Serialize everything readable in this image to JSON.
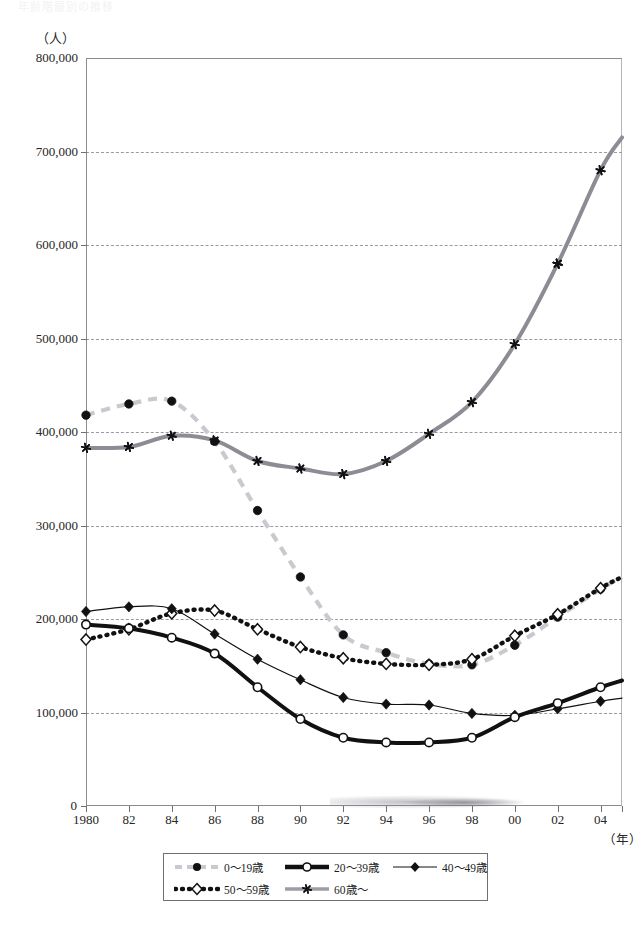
{
  "figure": {
    "title_faint": "年齢階層別の推移",
    "y_unit_label": "（人）",
    "x_unit_label": "（年）"
  },
  "axes": {
    "y_ticks": [
      "800,000",
      "700,000",
      "600,000",
      "500,000",
      "400,000",
      "300,000",
      "200,000",
      "100,000",
      "0"
    ],
    "y_tick_values": [
      800000,
      700000,
      600000,
      500000,
      400000,
      300000,
      200000,
      100000,
      0
    ],
    "x_ticks": [
      "1980",
      "82",
      "84",
      "86",
      "88",
      "90",
      "92",
      "94",
      "96",
      "98",
      "00",
      "02",
      "04"
    ],
    "x_tick_values": [
      1980,
      1982,
      1984,
      1986,
      1988,
      1990,
      1992,
      1994,
      1996,
      1998,
      2000,
      2002,
      2004
    ]
  },
  "legend": {
    "position": "bottom-center",
    "rows": [
      [
        {
          "label": "0〜19歳",
          "key": "dashed-lightgray-circle",
          "color": "#c9c9cf"
        },
        {
          "label": "20〜39歳",
          "key": "solid-thick-black-open-circle",
          "color": "#111111"
        },
        {
          "label": "40〜49歳",
          "key": "solid-thin-black-filled-diamond",
          "color": "#111111"
        }
      ],
      [
        {
          "label": "50〜59歳",
          "key": "dotted-black-open-diamond",
          "color": "#111111"
        },
        {
          "label": "60歳〜",
          "key": "solid-gray-asterisk",
          "color": "#8c8c94"
        }
      ]
    ]
  },
  "chart_data": {
    "type": "line",
    "title": "年齢階層別の推移",
    "xlabel": "（年）",
    "ylabel": "（人）",
    "xlim": [
      1980,
      2005
    ],
    "ylim": [
      0,
      800000
    ],
    "grid": true,
    "legend_position": "bottom-center",
    "x": [
      1980,
      1982,
      1984,
      1986,
      1988,
      1990,
      1992,
      1994,
      1996,
      1998,
      2000,
      2002,
      2004
    ],
    "series": [
      {
        "name": "0〜19歳",
        "color": "#c9c9cf",
        "marker": "circle-filled",
        "style": "dashed",
        "values": [
          418000,
          430000,
          433000,
          390000,
          316000,
          245000,
          183000,
          164000,
          152000,
          151000,
          172000,
          202000,
          232000
        ]
      },
      {
        "name": "20〜39歳",
        "color": "#111111",
        "marker": "circle-open",
        "style": "solid-thick",
        "values": [
          194000,
          190000,
          180000,
          163000,
          127000,
          93000,
          73000,
          68000,
          68000,
          73000,
          95000,
          110000,
          127000
        ]
      },
      {
        "name": "40〜49歳",
        "color": "#111111",
        "marker": "diamond-filled",
        "style": "solid-thin",
        "values": [
          208000,
          213000,
          211000,
          184000,
          157000,
          135000,
          116000,
          109000,
          108000,
          99000,
          97000,
          104000,
          112000
        ]
      },
      {
        "name": "50〜59歳",
        "color": "#111111",
        "marker": "diamond-open",
        "style": "dotted",
        "values": [
          178000,
          189000,
          206000,
          209000,
          189000,
          170000,
          158000,
          152000,
          151000,
          157000,
          182000,
          205000,
          233000
        ]
      },
      {
        "name": "60歳〜",
        "color": "#8c8c94",
        "marker": "asterisk",
        "style": "solid-gray",
        "values": [
          383000,
          384000,
          396000,
          391000,
          369000,
          361000,
          355000,
          369000,
          398000,
          432000,
          494000,
          580000,
          680000
        ]
      }
    ],
    "series_endpoint_2005": {
      "60歳〜": 715000
    }
  }
}
